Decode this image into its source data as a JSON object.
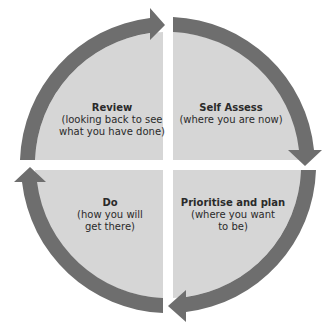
{
  "diagram": {
    "type": "cycle",
    "direction": "clockwise",
    "colors": {
      "arrow": "#6e6e6e",
      "quadrant_fill": "#d6d6d6",
      "text": "#2a2a2a",
      "background": "#ffffff"
    },
    "quadrants": [
      {
        "position": "top-left",
        "title": "Review",
        "subtitle": "(looking back to see what you have done)",
        "subtitle_lines": [
          "(looking back to see",
          "what you have done)"
        ]
      },
      {
        "position": "top-right",
        "title": "Self Assess",
        "subtitle": "(where you are now)",
        "subtitle_lines": [
          "(where you are now)"
        ]
      },
      {
        "position": "bottom-right",
        "title": "Prioritise and plan",
        "subtitle": "(where you want to be)",
        "subtitle_lines": [
          "(where you want",
          "to be)"
        ]
      },
      {
        "position": "bottom-left",
        "title": "Do",
        "subtitle": "(how you will get there)",
        "subtitle_lines": [
          "(how you will",
          "get there)"
        ]
      }
    ]
  }
}
